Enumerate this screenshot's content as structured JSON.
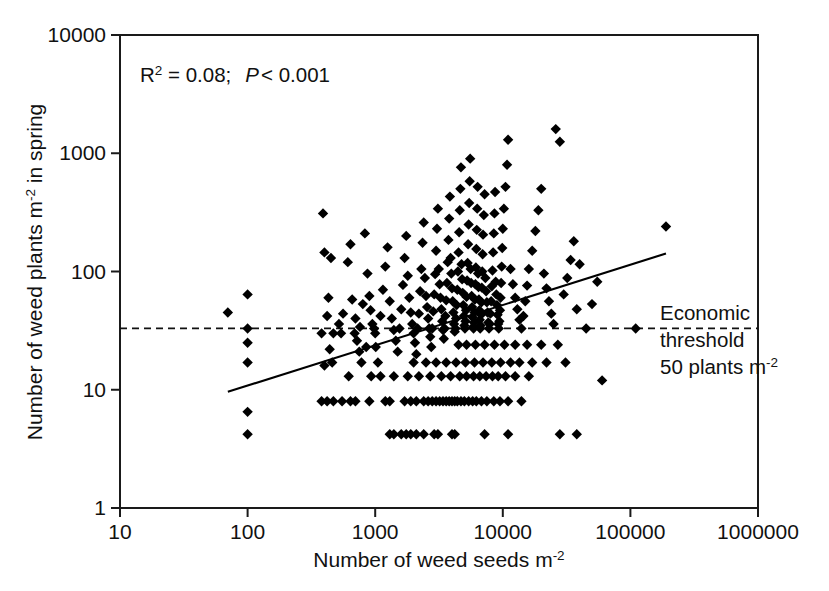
{
  "chart_data": {
    "type": "scatter",
    "title": "",
    "xlabel": "Number of weed seeds m-2",
    "xlabel_main": "Number of weed seeds m",
    "xlabel_sup": "-2",
    "ylabel_main_a": "Number of weed plants m",
    "ylabel_sup": "-2",
    "ylabel_main_b": " in spring",
    "ylabel": "Number of weed plants m-2 in spring",
    "xscale": "log",
    "yscale": "log",
    "xlim": [
      10,
      1000000
    ],
    "ylim": [
      1,
      10000
    ],
    "xticks": [
      10,
      100,
      1000,
      10000,
      100000,
      1000000
    ],
    "xtick_labels": [
      "10",
      "100",
      "1000",
      "10000",
      "100000",
      "1000000"
    ],
    "yticks": [
      1,
      10,
      100,
      1000,
      10000
    ],
    "ytick_labels": [
      "1",
      "10",
      "100",
      "1000",
      "10000"
    ],
    "grid": false,
    "legend": "none",
    "marker": "diamond",
    "marker_color": "#000000",
    "annotations": {
      "stats_r2_label": "R",
      "stats_r2_sup": "2",
      "stats_r2_value": " = 0.08;",
      "stats_p_label": "P",
      "stats_p_value": "< 0.001",
      "stats_full": "R2 = 0.08;  P < 0.001",
      "threshold_line_1": "Economic",
      "threshold_line_2": "threshold",
      "threshold_line_3a": "50 plants m",
      "threshold_line_3b": "-2",
      "threshold_full": "Economic threshold 50 plants m-2"
    },
    "threshold_line": {
      "type": "horizontal-dashed",
      "y_value": 33,
      "label": "Economic threshold 50 plants m-2"
    },
    "regression_line": {
      "type": "linear-fit-loglog",
      "x_start": 70,
      "y_start": 9.6,
      "x_end": 190000,
      "y_end": 142
    },
    "points": [
      [
        70,
        45
      ],
      [
        100,
        64
      ],
      [
        100,
        33
      ],
      [
        100,
        25
      ],
      [
        100,
        17
      ],
      [
        100,
        6.5
      ],
      [
        100,
        4.2
      ],
      [
        390,
        310
      ],
      [
        400,
        145
      ],
      [
        450,
        130
      ],
      [
        430,
        60
      ],
      [
        420,
        42
      ],
      [
        380,
        30
      ],
      [
        470,
        30
      ],
      [
        440,
        22
      ],
      [
        460,
        17
      ],
      [
        400,
        16
      ],
      [
        520,
        36
      ],
      [
        540,
        30
      ],
      [
        560,
        44
      ],
      [
        610,
        120
      ],
      [
        640,
        170
      ],
      [
        660,
        58
      ],
      [
        700,
        40
      ],
      [
        690,
        30
      ],
      [
        720,
        26
      ],
      [
        750,
        21
      ],
      [
        760,
        34
      ],
      [
        800,
        53
      ],
      [
        830,
        210
      ],
      [
        870,
        96
      ],
      [
        900,
        62
      ],
      [
        920,
        47
      ],
      [
        950,
        36
      ],
      [
        980,
        33
      ],
      [
        1000,
        30
      ],
      [
        1010,
        23
      ],
      [
        1050,
        17
      ],
      [
        1100,
        42
      ],
      [
        1150,
        70
      ],
      [
        1200,
        110
      ],
      [
        1250,
        160
      ],
      [
        1300,
        56
      ],
      [
        1350,
        40
      ],
      [
        1400,
        32
      ],
      [
        1450,
        26
      ],
      [
        1500,
        21
      ],
      [
        1550,
        33
      ],
      [
        1600,
        48
      ],
      [
        1650,
        77
      ],
      [
        1700,
        130
      ],
      [
        1750,
        200
      ],
      [
        1800,
        92
      ],
      [
        1850,
        60
      ],
      [
        1900,
        45
      ],
      [
        1950,
        36
      ],
      [
        2000,
        30
      ],
      [
        2050,
        25
      ],
      [
        2100,
        20
      ],
      [
        2150,
        33
      ],
      [
        2200,
        44
      ],
      [
        2250,
        68
      ],
      [
        2300,
        105
      ],
      [
        2350,
        175
      ],
      [
        2400,
        260
      ],
      [
        2450,
        88
      ],
      [
        2500,
        62
      ],
      [
        2550,
        50
      ],
      [
        2600,
        40
      ],
      [
        2650,
        33
      ],
      [
        2700,
        28
      ],
      [
        2750,
        23
      ],
      [
        2800,
        33
      ],
      [
        2850,
        46
      ],
      [
        2900,
        64
      ],
      [
        2950,
        95
      ],
      [
        3000,
        150
      ],
      [
        3050,
        230
      ],
      [
        3100,
        340
      ],
      [
        3150,
        105
      ],
      [
        3200,
        78
      ],
      [
        3250,
        60
      ],
      [
        3300,
        48
      ],
      [
        3350,
        38
      ],
      [
        3400,
        32
      ],
      [
        3450,
        27
      ],
      [
        3500,
        33
      ],
      [
        3550,
        42
      ],
      [
        3600,
        57
      ],
      [
        3650,
        80
      ],
      [
        3700,
        120
      ],
      [
        3750,
        185
      ],
      [
        3800,
        280
      ],
      [
        3850,
        430
      ],
      [
        3900,
        130
      ],
      [
        3950,
        96
      ],
      [
        4000,
        72
      ],
      [
        4050,
        56
      ],
      [
        4100,
        45
      ],
      [
        4150,
        36
      ],
      [
        4200,
        31
      ],
      [
        4250,
        33
      ],
      [
        4300,
        40
      ],
      [
        4350,
        52
      ],
      [
        4400,
        70
      ],
      [
        4450,
        100
      ],
      [
        4500,
        145
      ],
      [
        4550,
        215
      ],
      [
        4600,
        330
      ],
      [
        4650,
        500
      ],
      [
        4700,
        760
      ],
      [
        4750,
        115
      ],
      [
        4800,
        86
      ],
      [
        4850,
        66
      ],
      [
        4900,
        52
      ],
      [
        4950,
        42
      ],
      [
        5000,
        35
      ],
      [
        5050,
        33
      ],
      [
        5100,
        38
      ],
      [
        5150,
        47
      ],
      [
        5200,
        61
      ],
      [
        5250,
        84
      ],
      [
        5300,
        118
      ],
      [
        5350,
        170
      ],
      [
        5400,
        250
      ],
      [
        5450,
        380
      ],
      [
        5500,
        580
      ],
      [
        5550,
        900
      ],
      [
        5600,
        105
      ],
      [
        5650,
        80
      ],
      [
        5700,
        62
      ],
      [
        5750,
        50
      ],
      [
        5800,
        41
      ],
      [
        5850,
        34
      ],
      [
        5900,
        33
      ],
      [
        5950,
        37
      ],
      [
        6000,
        45
      ],
      [
        6050,
        58
      ],
      [
        6100,
        78
      ],
      [
        6150,
        108
      ],
      [
        6200,
        155
      ],
      [
        6250,
        225
      ],
      [
        6300,
        340
      ],
      [
        6350,
        520
      ],
      [
        6400,
        96
      ],
      [
        6450,
        74
      ],
      [
        6500,
        58
      ],
      [
        6550,
        47
      ],
      [
        6600,
        39
      ],
      [
        6650,
        33
      ],
      [
        6700,
        35
      ],
      [
        6750,
        43
      ],
      [
        6800,
        55
      ],
      [
        6850,
        73
      ],
      [
        6900,
        100
      ],
      [
        6950,
        140
      ],
      [
        7000,
        205
      ],
      [
        7100,
        300
      ],
      [
        7200,
        450
      ],
      [
        7300,
        88
      ],
      [
        7400,
        68
      ],
      [
        7500,
        55
      ],
      [
        7600,
        45
      ],
      [
        7700,
        37
      ],
      [
        7800,
        33
      ],
      [
        7900,
        36
      ],
      [
        8000,
        44
      ],
      [
        8100,
        56
      ],
      [
        8200,
        75
      ],
      [
        8300,
        102
      ],
      [
        8400,
        145
      ],
      [
        8500,
        210
      ],
      [
        8600,
        310
      ],
      [
        8700,
        470
      ],
      [
        8800,
        82
      ],
      [
        8900,
        64
      ],
      [
        9000,
        52
      ],
      [
        9100,
        43
      ],
      [
        9200,
        36
      ],
      [
        9300,
        33
      ],
      [
        9400,
        38
      ],
      [
        9500,
        47
      ],
      [
        9600,
        60
      ],
      [
        9700,
        80
      ],
      [
        9800,
        110
      ],
      [
        9900,
        158
      ],
      [
        10000,
        230
      ],
      [
        10200,
        340
      ],
      [
        10500,
        520
      ],
      [
        10800,
        800
      ],
      [
        11000,
        1300
      ],
      [
        11500,
        105
      ],
      [
        12000,
        78
      ],
      [
        12500,
        60
      ],
      [
        13000,
        48
      ],
      [
        13500,
        39
      ],
      [
        14000,
        33
      ],
      [
        14500,
        42
      ],
      [
        15000,
        56
      ],
      [
        15500,
        76
      ],
      [
        16000,
        105
      ],
      [
        17000,
        150
      ],
      [
        18000,
        220
      ],
      [
        19000,
        330
      ],
      [
        20000,
        500
      ],
      [
        21000,
        96
      ],
      [
        22000,
        72
      ],
      [
        23000,
        56
      ],
      [
        24000,
        44
      ],
      [
        25000,
        36
      ],
      [
        26000,
        1600
      ],
      [
        28000,
        1250
      ],
      [
        30000,
        64
      ],
      [
        32000,
        88
      ],
      [
        34000,
        125
      ],
      [
        36000,
        180
      ],
      [
        38000,
        48
      ],
      [
        40000,
        115
      ],
      [
        45000,
        33
      ],
      [
        50000,
        53
      ],
      [
        55000,
        82
      ],
      [
        60000,
        12
      ],
      [
        110000,
        33
      ],
      [
        190000,
        240
      ],
      [
        640,
        8
      ],
      [
        700,
        8
      ],
      [
        900,
        8
      ],
      [
        1200,
        8
      ],
      [
        1300,
        8
      ],
      [
        1700,
        8
      ],
      [
        1900,
        8
      ],
      [
        2100,
        8
      ],
      [
        2400,
        8
      ],
      [
        2600,
        8
      ],
      [
        2800,
        8
      ],
      [
        3000,
        8
      ],
      [
        3200,
        8
      ],
      [
        3400,
        8
      ],
      [
        3600,
        8
      ],
      [
        3800,
        8
      ],
      [
        4000,
        8
      ],
      [
        4200,
        8
      ],
      [
        4400,
        8
      ],
      [
        4700,
        8
      ],
      [
        5000,
        8
      ],
      [
        5400,
        8
      ],
      [
        5800,
        8
      ],
      [
        6200,
        8
      ],
      [
        6800,
        8
      ],
      [
        7500,
        8
      ],
      [
        8500,
        8
      ],
      [
        9500,
        8
      ],
      [
        11000,
        8
      ],
      [
        14000,
        8
      ],
      [
        1300,
        4.2
      ],
      [
        1400,
        4.2
      ],
      [
        1600,
        4.2
      ],
      [
        1750,
        4.2
      ],
      [
        1900,
        4.2
      ],
      [
        2100,
        4.2
      ],
      [
        2400,
        4.2
      ],
      [
        2900,
        4.2
      ],
      [
        3100,
        4.2
      ],
      [
        4000,
        4.2
      ],
      [
        4200,
        4.2
      ],
      [
        7200,
        4.2
      ],
      [
        11000,
        4.2
      ],
      [
        28000,
        4.2
      ],
      [
        38000,
        4.2
      ],
      [
        380,
        8
      ],
      [
        420,
        8
      ],
      [
        470,
        8
      ],
      [
        1800,
        13
      ],
      [
        2200,
        13
      ],
      [
        2700,
        13
      ],
      [
        3300,
        13
      ],
      [
        3900,
        13
      ],
      [
        4600,
        13
      ],
      [
        5200,
        13
      ],
      [
        5900,
        13
      ],
      [
        6600,
        13
      ],
      [
        7400,
        13
      ],
      [
        8300,
        13
      ],
      [
        9200,
        13
      ],
      [
        10500,
        13
      ],
      [
        12500,
        13
      ],
      [
        16000,
        13
      ],
      [
        930,
        13
      ],
      [
        1100,
        13
      ],
      [
        1400,
        13
      ],
      [
        2000,
        17
      ],
      [
        2500,
        17
      ],
      [
        3000,
        17
      ],
      [
        3600,
        17
      ],
      [
        4300,
        17
      ],
      [
        5100,
        17
      ],
      [
        6000,
        17
      ],
      [
        7000,
        17
      ],
      [
        8200,
        17
      ],
      [
        9600,
        17
      ],
      [
        11500,
        17
      ],
      [
        13500,
        17
      ],
      [
        17000,
        17
      ],
      [
        22000,
        17
      ],
      [
        31000,
        17
      ],
      [
        550,
        8
      ],
      [
        620,
        13
      ],
      [
        780,
        17
      ],
      [
        850,
        23
      ],
      [
        4500,
        24
      ],
      [
        5200,
        24
      ],
      [
        6100,
        24
      ],
      [
        7200,
        24
      ],
      [
        8600,
        24
      ],
      [
        10300,
        24
      ],
      [
        12500,
        24
      ],
      [
        15500,
        24
      ],
      [
        20000,
        24
      ],
      [
        27000,
        24
      ]
    ]
  }
}
